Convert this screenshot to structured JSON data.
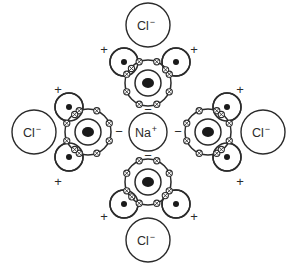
{
  "figure": {
    "background_color": "#ffffff",
    "stroke_color": "#2b2b2b",
    "nucleus_color": "#1a1a1a",
    "width": 297,
    "height": 265
  },
  "central_ion": {
    "name": "sodium-cation",
    "symbol": "Na",
    "charge": "+",
    "cx": 148,
    "cy": 132,
    "r": 19
  },
  "chloride_ions": [
    {
      "name": "chloride-top",
      "symbol": "Cl",
      "charge": "−",
      "cx": 148,
      "cy": 25,
      "r": 22
    },
    {
      "name": "chloride-left",
      "symbol": "Cl",
      "charge": "−",
      "cx": 34,
      "cy": 132,
      "r": 22
    },
    {
      "name": "chloride-right",
      "symbol": "Cl",
      "charge": "−",
      "cx": 263,
      "cy": 132,
      "r": 22
    },
    {
      "name": "chloride-bottom",
      "symbol": "Cl",
      "charge": "−",
      "cx": 148,
      "cy": 240,
      "r": 22
    }
  ],
  "water_molecules": [
    {
      "name": "water-top",
      "orientation": "hydrogens-up",
      "oxygen": {
        "cx": 148,
        "cy": 83,
        "r_inner": 13,
        "r_outer": 23,
        "nucleus_r": 5
      },
      "hydrogens": [
        {
          "cx": 124,
          "cy": 62,
          "r": 14,
          "proton_r": 3
        },
        {
          "cx": 176,
          "cy": 62,
          "r": 14,
          "proton_r": 3
        }
      ],
      "charge_labels": [
        {
          "sign": "+",
          "x": 104,
          "y": 50
        },
        {
          "sign": "+",
          "x": 194,
          "y": 50
        },
        {
          "sign": "−",
          "x": 148,
          "y": 110
        }
      ]
    },
    {
      "name": "water-left",
      "orientation": "hydrogens-left",
      "oxygen": {
        "cx": 88,
        "cy": 132,
        "r_inner": 13,
        "r_outer": 23,
        "nucleus_r": 5
      },
      "hydrogens": [
        {
          "cx": 69,
          "cy": 107,
          "r": 14,
          "proton_r": 3
        },
        {
          "cx": 69,
          "cy": 157,
          "r": 14,
          "proton_r": 3
        }
      ],
      "charge_labels": [
        {
          "sign": "+",
          "x": 58,
          "y": 90
        },
        {
          "sign": "+",
          "x": 58,
          "y": 182
        },
        {
          "sign": "−",
          "x": 119,
          "y": 132
        }
      ]
    },
    {
      "name": "water-right",
      "orientation": "hydrogens-right",
      "oxygen": {
        "cx": 208,
        "cy": 132,
        "r_inner": 13,
        "r_outer": 23,
        "nucleus_r": 5
      },
      "hydrogens": [
        {
          "cx": 227,
          "cy": 107,
          "r": 14,
          "proton_r": 3
        },
        {
          "cx": 227,
          "cy": 157,
          "r": 14,
          "proton_r": 3
        }
      ],
      "charge_labels": [
        {
          "sign": "+",
          "x": 240,
          "y": 90
        },
        {
          "sign": "+",
          "x": 240,
          "y": 182
        },
        {
          "sign": "−",
          "x": 178,
          "y": 132
        }
      ]
    },
    {
      "name": "water-bottom",
      "orientation": "hydrogens-down",
      "oxygen": {
        "cx": 148,
        "cy": 182,
        "r_inner": 13,
        "r_outer": 23,
        "nucleus_r": 5
      },
      "hydrogens": [
        {
          "cx": 124,
          "cy": 204,
          "r": 14,
          "proton_r": 3
        },
        {
          "cx": 176,
          "cy": 204,
          "r": 14,
          "proton_r": 3
        }
      ],
      "charge_labels": [
        {
          "sign": "+",
          "x": 104,
          "y": 217
        },
        {
          "sign": "+",
          "x": 194,
          "y": 217
        },
        {
          "sign": "−",
          "x": 148,
          "y": 156
        }
      ]
    }
  ],
  "legend": {
    "oxygen_shell_electron_count": 8,
    "hydrogen_proton_label": "proton",
    "electron_glyph": "crossed-circle"
  }
}
